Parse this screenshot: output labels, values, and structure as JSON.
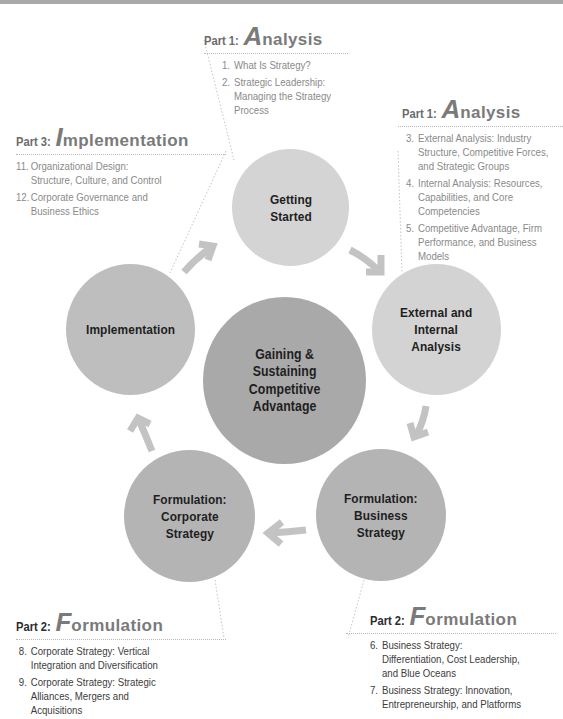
{
  "colors": {
    "background": "#ffffff",
    "top_bar": "#a9a9a9",
    "circle_light": "#d4d4d4",
    "circle_mid": "#bcbcbc",
    "circle_dark": "#b3b3b3",
    "circle_center": "#a8a8a8",
    "arrow": "#c2c2c2",
    "dotted_line": "#b8b8b8",
    "label_text": "#1e1e1e",
    "list_text_light": "#8a8a8a",
    "list_text_dark": "#3c3c3c"
  },
  "circles": {
    "getting_started": {
      "label": "Getting\nStarted"
    },
    "external_internal": {
      "label": "External and\nInternal\nAnalysis"
    },
    "formulation_business": {
      "label": "Formulation:\nBusiness\nStrategy"
    },
    "formulation_corporate": {
      "label": "Formulation:\nCorporate\nStrategy"
    },
    "implementation": {
      "label": "Implementation"
    },
    "center": {
      "label": "Gaining &\nSustaining\nCompetitive\nAdvantage"
    }
  },
  "parts": {
    "analysis_top": {
      "prefix": "Part 1:",
      "initial": "A",
      "rest": "nalysis",
      "items": [
        {
          "num": "1.",
          "text": "What Is Strategy?"
        },
        {
          "num": "2.",
          "text": "Strategic Leadership: Managing the Strategy Process"
        }
      ]
    },
    "analysis_right": {
      "prefix": "Part 1:",
      "initial": "A",
      "rest": "nalysis",
      "items": [
        {
          "num": "3.",
          "text": "External Analysis: Industry Structure, Competitive Forces, and Strategic Groups"
        },
        {
          "num": "4.",
          "text": "Internal Analysis: Resources, Capabilities, and Core Competencies"
        },
        {
          "num": "5.",
          "text": "Competitive Advantage, Firm Performance, and Business Models"
        }
      ]
    },
    "implementation": {
      "prefix": "Part 3:",
      "initial": "I",
      "rest": "mplementation",
      "items": [
        {
          "num": "11.",
          "text": "Organizational Design: Structure, Culture, and Control"
        },
        {
          "num": "12.",
          "text": "Corporate Governance and Business Ethics"
        }
      ]
    },
    "formulation_left": {
      "prefix": "Part 2:",
      "initial": "F",
      "rest": "ormulation",
      "items": [
        {
          "num": "8.",
          "text": "Corporate Strategy: Vertical Integration and Diversification"
        },
        {
          "num": "9.",
          "text": "Corporate Strategy: Strategic Alliances, Mergers and Acquisitions"
        },
        {
          "num": "10.",
          "text": "Global Strategy: Competing Around"
        }
      ]
    },
    "formulation_right": {
      "prefix": "Part 2:",
      "initial": "F",
      "rest": "ormulation",
      "items": [
        {
          "num": "6.",
          "text": "Business Strategy: Differentiation, Cost Leadership, and Blue Oceans"
        },
        {
          "num": "7.",
          "text": "Business Strategy: Innovation, Entrepreneurship, and Platforms"
        }
      ]
    }
  }
}
